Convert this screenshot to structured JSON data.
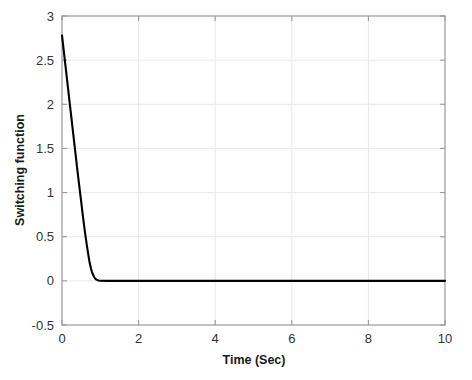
{
  "chart_data": {
    "type": "line",
    "title": "",
    "xlabel": "Time (Sec)",
    "ylabel": "Switching function",
    "xlim": [
      0,
      10
    ],
    "ylim": [
      -0.5,
      3
    ],
    "xticks": [
      0,
      2,
      4,
      6,
      8,
      10
    ],
    "yticks": [
      -0.5,
      0,
      0.5,
      1,
      1.5,
      2,
      2.5,
      3
    ],
    "xtick_labels": [
      "0",
      "2",
      "4",
      "6",
      "8",
      "10"
    ],
    "ytick_labels": [
      "-0.5",
      "0",
      "0.5",
      "1",
      "1.5",
      "2",
      "2.5",
      "3"
    ],
    "grid": true,
    "legend": null,
    "line_color": "#000000",
    "grid_color": "#e8e8e8",
    "axis_color": "#9a9a9a",
    "series": [
      {
        "name": "Switching function",
        "x": [
          0.0,
          0.05,
          0.1,
          0.15,
          0.2,
          0.25,
          0.3,
          0.35,
          0.4,
          0.45,
          0.5,
          0.55,
          0.6,
          0.65,
          0.7,
          0.72,
          0.74,
          0.76,
          0.78,
          0.8,
          0.82,
          0.84,
          0.86,
          0.88,
          0.9,
          0.95,
          1.0,
          1.2,
          1.5,
          2.0,
          2.5,
          3.0,
          4.0,
          5.0,
          6.0,
          7.0,
          8.0,
          9.0,
          10.0
        ],
        "values": [
          2.78,
          2.59,
          2.4,
          2.21,
          2.02,
          1.83,
          1.64,
          1.45,
          1.26,
          1.08,
          0.9,
          0.72,
          0.55,
          0.4,
          0.26,
          0.21,
          0.17,
          0.135,
          0.105,
          0.08,
          0.06,
          0.044,
          0.031,
          0.021,
          0.014,
          0.005,
          0.002,
          0.0,
          0.0,
          0.0,
          0.0,
          0.0,
          0.0,
          0.0,
          0.0,
          0.0,
          0.0,
          0.0,
          0.0
        ]
      }
    ]
  }
}
